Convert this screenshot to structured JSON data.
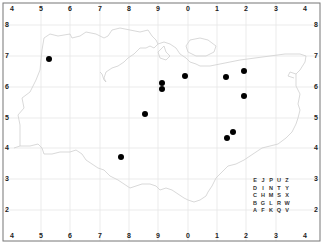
{
  "map": {
    "frame": {
      "left": 3,
      "top": 3,
      "right": 320,
      "bottom": 241
    },
    "colors": {
      "frame": "#777777",
      "grid": "#e6e6e6",
      "coast": "#cfcfcf",
      "dot": "#000000"
    },
    "top_labels": [
      {
        "text": "4",
        "x": 12
      },
      {
        "text": "5",
        "x": 41
      },
      {
        "text": "6",
        "x": 70
      },
      {
        "text": "7",
        "x": 100
      },
      {
        "text": "8",
        "x": 129
      },
      {
        "text": "9",
        "x": 158
      },
      {
        "text": "0",
        "x": 188
      },
      {
        "text": "1",
        "x": 217
      },
      {
        "text": "2",
        "x": 246
      },
      {
        "text": "3",
        "x": 276
      },
      {
        "text": "4",
        "x": 305
      }
    ],
    "bottom_labels": [
      {
        "text": "4",
        "x": 12
      },
      {
        "text": "5",
        "x": 41
      },
      {
        "text": "6",
        "x": 70
      },
      {
        "text": "7",
        "x": 100
      },
      {
        "text": "8",
        "x": 129
      },
      {
        "text": "9",
        "x": 158
      },
      {
        "text": "0",
        "x": 188
      },
      {
        "text": "1",
        "x": 217
      },
      {
        "text": "2",
        "x": 246
      },
      {
        "text": "3",
        "x": 276
      },
      {
        "text": "4",
        "x": 305
      }
    ],
    "left_labels": [
      {
        "text": "8",
        "y": 25
      },
      {
        "text": "7",
        "y": 56
      },
      {
        "text": "6",
        "y": 87
      },
      {
        "text": "5",
        "y": 118
      },
      {
        "text": "4",
        "y": 148
      },
      {
        "text": "3",
        "y": 179
      },
      {
        "text": "2",
        "y": 210
      }
    ],
    "right_labels": [
      {
        "text": "8",
        "y": 25
      },
      {
        "text": "7",
        "y": 56
      },
      {
        "text": "6",
        "y": 87
      },
      {
        "text": "5",
        "y": 118
      },
      {
        "text": "4",
        "y": 148
      },
      {
        "text": "3",
        "y": 179
      },
      {
        "text": "2",
        "y": 210
      }
    ],
    "grid_x": [
      41,
      70,
      100,
      129,
      158,
      188,
      217,
      246,
      276
    ],
    "grid_y": [
      25,
      56,
      87,
      118,
      148,
      179,
      210
    ],
    "dots": [
      {
        "x": 49,
        "y": 59
      },
      {
        "x": 162,
        "y": 83
      },
      {
        "x": 162,
        "y": 89
      },
      {
        "x": 185,
        "y": 76
      },
      {
        "x": 226,
        "y": 77
      },
      {
        "x": 244,
        "y": 71
      },
      {
        "x": 244,
        "y": 96
      },
      {
        "x": 145,
        "y": 114
      },
      {
        "x": 233,
        "y": 132
      },
      {
        "x": 227,
        "y": 138
      },
      {
        "x": 121,
        "y": 157
      }
    ],
    "letter_grid": [
      [
        "E",
        "J",
        "P",
        "U",
        "Z"
      ],
      [
        "D",
        "I",
        "N",
        "T",
        "Y"
      ],
      [
        "C",
        "H",
        "M",
        "S",
        "X"
      ],
      [
        "B",
        "G",
        "L",
        "R",
        "W"
      ],
      [
        "A",
        "F",
        "K",
        "Q",
        "V"
      ]
    ]
  }
}
